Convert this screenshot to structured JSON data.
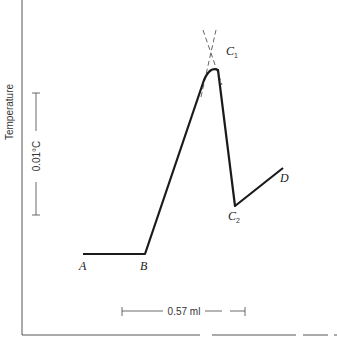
{
  "chart_data": {
    "type": "line",
    "title": "",
    "xlabel": "",
    "ylabel": "Temperature",
    "grid": false,
    "x_scale_bar": {
      "label": "0.57 ml",
      "value_ml": 0.57
    },
    "y_scale_bar": {
      "label": "0.01°C",
      "value_degC": 0.01
    },
    "series": [
      {
        "name": "thermometric titration curve",
        "points": [
          {
            "label": "A",
            "x": 0.0,
            "y": 0.0
          },
          {
            "label": "B",
            "x": 0.29,
            "y": 0.0
          },
          {
            "label": "",
            "x": 0.55,
            "y": 0.015
          },
          {
            "label": "",
            "x": 0.63,
            "y": 0.0152
          },
          {
            "label": "C2",
            "x": 0.72,
            "y": 0.0039
          },
          {
            "label": "D",
            "x": 0.93,
            "y": 0.007
          }
        ]
      }
    ],
    "extrapolation_lines": {
      "style": "dashed",
      "intersection_label": "C1",
      "intersection": {
        "x": 0.59,
        "y": 0.0168
      }
    },
    "point_labels": [
      "A",
      "B",
      "C1",
      "C2",
      "D"
    ]
  }
}
